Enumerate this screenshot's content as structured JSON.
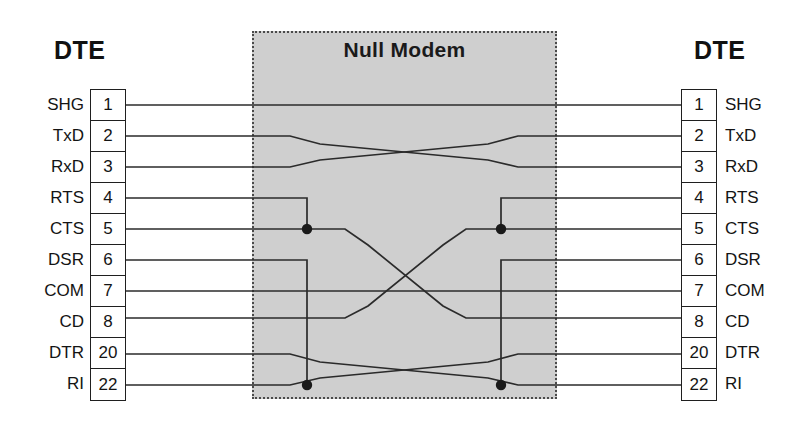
{
  "diagram": {
    "title": "Null Modem",
    "type": "null-modem-cable-wiring",
    "left_device_label": "DTE",
    "right_device_label": "DTE",
    "box": {
      "label": "Null Modem",
      "fill_color": "#cfcfcf",
      "border_color": "#4a4a4a",
      "border_style": "dotted"
    },
    "wire_color": "#2b2b2b",
    "left_connector": {
      "name": "DTE",
      "pins": [
        {
          "number": "1",
          "signal": "SHG"
        },
        {
          "number": "2",
          "signal": "TxD"
        },
        {
          "number": "3",
          "signal": "RxD"
        },
        {
          "number": "4",
          "signal": "RTS"
        },
        {
          "number": "5",
          "signal": "CTS"
        },
        {
          "number": "6",
          "signal": "DSR"
        },
        {
          "number": "7",
          "signal": "COM"
        },
        {
          "number": "8",
          "signal": "CD"
        },
        {
          "number": "20",
          "signal": "DTR"
        },
        {
          "number": "22",
          "signal": "RI"
        }
      ]
    },
    "right_connector": {
      "name": "DTE",
      "pins": [
        {
          "number": "1",
          "signal": "SHG"
        },
        {
          "number": "2",
          "signal": "TxD"
        },
        {
          "number": "3",
          "signal": "RxD"
        },
        {
          "number": "4",
          "signal": "RTS"
        },
        {
          "number": "5",
          "signal": "CTS"
        },
        {
          "number": "6",
          "signal": "DSR"
        },
        {
          "number": "7",
          "signal": "COM"
        },
        {
          "number": "8",
          "signal": "CD"
        },
        {
          "number": "20",
          "signal": "DTR"
        },
        {
          "number": "22",
          "signal": "RI"
        }
      ]
    },
    "connections": [
      {
        "from": "1",
        "to": "1",
        "kind": "straight",
        "description": "SHG to SHG"
      },
      {
        "from": "2",
        "to": "3",
        "kind": "crossed",
        "description": "TxD to RxD"
      },
      {
        "from": "3",
        "to": "2",
        "kind": "crossed",
        "description": "RxD to TxD"
      },
      {
        "from": "4",
        "to": "5",
        "kind": "local-loopback-left",
        "description": "RTS tied to CTS on left side"
      },
      {
        "from": "5",
        "to": "8",
        "kind": "crossed",
        "description": "CTS to CD"
      },
      {
        "from": "6",
        "to": "22",
        "kind": "local-loopback-left",
        "description": "DSR tied to RI on left side"
      },
      {
        "from": "7",
        "to": "7",
        "kind": "straight",
        "description": "COM to COM"
      },
      {
        "from": "8",
        "to": "5",
        "kind": "crossed",
        "description": "CD to CTS"
      },
      {
        "from": "20",
        "to": "22",
        "kind": "crossed",
        "description": "DTR to RI"
      },
      {
        "from": "22",
        "to": "20",
        "kind": "crossed",
        "description": "RI to DTR"
      },
      {
        "from": "4",
        "to": "5",
        "kind": "local-loopback-right",
        "description": "RTS tied to CTS on right side"
      },
      {
        "from": "6",
        "to": "22",
        "kind": "local-loopback-right",
        "description": "DSR tied to RI on right side"
      }
    ],
    "junction_dots": [
      {
        "at": "left-pin-5",
        "signals": [
          "RTS",
          "CTS"
        ]
      },
      {
        "at": "right-pin-5",
        "signals": [
          "RTS",
          "CTS"
        ]
      },
      {
        "at": "left-pin-22",
        "signals": [
          "DSR",
          "RI"
        ]
      },
      {
        "at": "right-pin-22",
        "signals": [
          "DSR",
          "RI"
        ]
      }
    ]
  }
}
